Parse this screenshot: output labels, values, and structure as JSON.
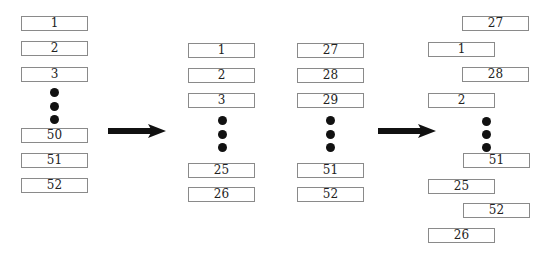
{
  "diagram": {
    "stage1": {
      "label": "original deck",
      "cards": [
        {
          "label": "1",
          "x": 21,
          "y": 16
        },
        {
          "label": "2",
          "x": 21,
          "y": 41
        },
        {
          "label": "3",
          "x": 21,
          "y": 67
        },
        {
          "label": "50",
          "x": 21,
          "y": 128
        },
        {
          "label": "51",
          "x": 21,
          "y": 153
        },
        {
          "label": "52",
          "x": 21,
          "y": 178
        }
      ],
      "dots": [
        {
          "x": 50,
          "y": 88
        },
        {
          "x": 50,
          "y": 102
        },
        {
          "x": 50,
          "y": 115
        }
      ]
    },
    "stage2": {
      "label": "split halves",
      "left_half": [
        {
          "label": "1",
          "x": 188,
          "y": 43
        },
        {
          "label": "2",
          "x": 188,
          "y": 68
        },
        {
          "label": "3",
          "x": 188,
          "y": 93
        },
        {
          "label": "25",
          "x": 188,
          "y": 163
        },
        {
          "label": "26",
          "x": 188,
          "y": 187
        }
      ],
      "right_half": [
        {
          "label": "27",
          "x": 297,
          "y": 43
        },
        {
          "label": "28",
          "x": 297,
          "y": 68
        },
        {
          "label": "29",
          "x": 297,
          "y": 93
        },
        {
          "label": "51",
          "x": 297,
          "y": 163
        },
        {
          "label": "52",
          "x": 297,
          "y": 187
        }
      ],
      "dots": [
        {
          "x": 218,
          "y": 116
        },
        {
          "x": 218,
          "y": 130
        },
        {
          "x": 218,
          "y": 143
        },
        {
          "x": 326,
          "y": 116
        },
        {
          "x": 326,
          "y": 130
        },
        {
          "x": 326,
          "y": 143
        }
      ]
    },
    "stage3": {
      "label": "interleaved deck",
      "cards": [
        {
          "label": "27",
          "x": 462,
          "y": 16
        },
        {
          "label": "1",
          "x": 428,
          "y": 42
        },
        {
          "label": "28",
          "x": 462,
          "y": 67
        },
        {
          "label": "2",
          "x": 428,
          "y": 93
        },
        {
          "label": "51",
          "x": 463,
          "y": 153
        },
        {
          "label": "25",
          "x": 428,
          "y": 179
        },
        {
          "label": "52",
          "x": 463,
          "y": 203
        },
        {
          "label": "26",
          "x": 428,
          "y": 228
        }
      ],
      "dots": [
        {
          "x": 482,
          "y": 117
        },
        {
          "x": 482,
          "y": 130
        },
        {
          "x": 482,
          "y": 143
        }
      ]
    },
    "arrows": [
      {
        "name": "split-arrow",
        "x1": 108,
        "x2": 166,
        "y": 131
      },
      {
        "name": "interleave-arrow",
        "x1": 378,
        "x2": 436,
        "y": 131
      }
    ]
  }
}
